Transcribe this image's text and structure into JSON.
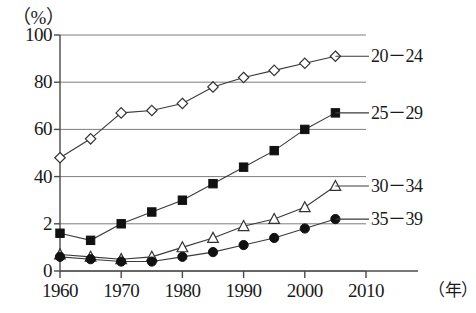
{
  "figure": {
    "top_clipped_text": "―――――――――――――――――――",
    "unit_label": "（%）",
    "xaxis_unit": "（年）"
  },
  "chart_data": {
    "type": "line",
    "title": "",
    "subtitle": "",
    "xlabel": "（年）",
    "ylabel": "（%）",
    "xlim": [
      1960,
      2010
    ],
    "ylim": [
      0,
      100
    ],
    "grid": true,
    "legend_position": "right-inline",
    "x": [
      1960,
      1965,
      1970,
      1975,
      1980,
      1985,
      1990,
      1995,
      2000,
      2005
    ],
    "xticks": [
      "1960",
      "1970",
      "1980",
      "1990",
      "2000",
      "2010"
    ],
    "xtick_values": [
      1960,
      1970,
      1980,
      1990,
      2000,
      2010
    ],
    "yticks": [
      "100",
      "80",
      "60",
      "40",
      "2",
      "0"
    ],
    "ytick_values": [
      100,
      80,
      60,
      40,
      20,
      0
    ],
    "series": [
      {
        "name": "20－24",
        "marker": "open-diamond",
        "values": [
          48,
          56,
          67,
          68,
          71,
          78,
          82,
          85,
          88,
          91
        ]
      },
      {
        "name": "25－29",
        "marker": "filled-square",
        "values": [
          16,
          13,
          20,
          25,
          30,
          37,
          44,
          51,
          60,
          67
        ]
      },
      {
        "name": "30－34",
        "marker": "open-triangle",
        "values": [
          7,
          6,
          5,
          6,
          10,
          14,
          19,
          22,
          27,
          36
        ]
      },
      {
        "name": "35－39",
        "marker": "filled-circle",
        "values": [
          6,
          5,
          4,
          4,
          6,
          8,
          11,
          14,
          18,
          22
        ]
      }
    ]
  }
}
